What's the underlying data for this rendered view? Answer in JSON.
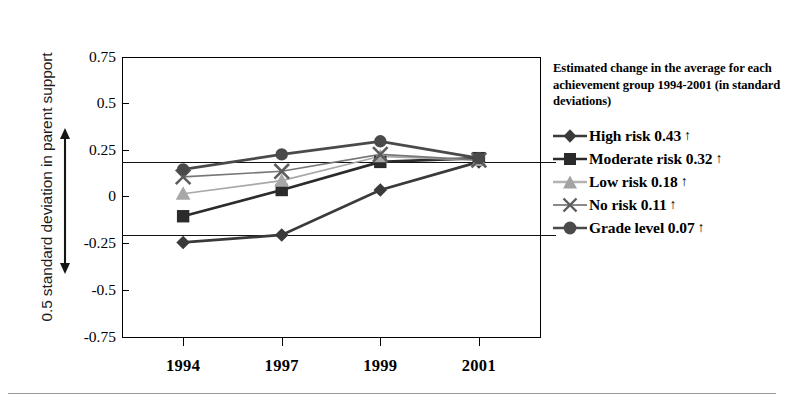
{
  "chart_data": {
    "type": "line",
    "title": "",
    "xlabel": "",
    "ylabel": "0.5 standard deviation in parent support",
    "categories": [
      "1994",
      "1997",
      "1999",
      "2001"
    ],
    "ylim": [
      -0.75,
      0.75
    ],
    "yticks": [
      "0.75",
      "0.5",
      "0.25",
      "0",
      "-0.25",
      "-0.5",
      "-0.75"
    ],
    "ytick_values": [
      0.75,
      0.5,
      0.25,
      0,
      -0.25,
      -0.5,
      -0.75
    ],
    "grid": false,
    "legend_position": "right",
    "reference_lines": [
      0.19,
      -0.2
    ],
    "series": [
      {
        "name": "High risk",
        "marker": "diamond",
        "color": "#3a3a3a",
        "change": "0.43",
        "direction": "up",
        "values": [
          -0.24,
          -0.2,
          0.04,
          0.19
        ]
      },
      {
        "name": "Moderate risk",
        "marker": "square",
        "color": "#2b2b2b",
        "change": "0.32",
        "direction": "up",
        "values": [
          -0.1,
          0.04,
          0.19,
          0.21
        ]
      },
      {
        "name": "Low risk",
        "marker": "triangle",
        "color": "#a8a8a8",
        "change": "0.18",
        "direction": "up",
        "values": [
          0.02,
          0.09,
          0.22,
          0.2
        ]
      },
      {
        "name": "No risk",
        "marker": "x",
        "color": "#777777",
        "change": "0.11",
        "direction": "up",
        "values": [
          0.11,
          0.14,
          0.23,
          0.2
        ]
      },
      {
        "name": "Grade level",
        "marker": "circle",
        "color": "#4a4a4a",
        "change": "0.07",
        "direction": "up",
        "values": [
          0.15,
          0.23,
          0.3,
          0.21
        ]
      }
    ]
  },
  "legend": {
    "caption": "Estimated change in the average for each achievement group 1994-2001 (in standard deviations)",
    "arrow_glyph": "↑",
    "entries": [
      {
        "label": "High risk 0.43",
        "marker_name": "diamond-marker-icon"
      },
      {
        "label": "Moderate risk 0.32",
        "marker_name": "square-marker-icon"
      },
      {
        "label": "Low risk 0.18",
        "marker_name": "triangle-marker-icon"
      },
      {
        "label": "No risk 0.11",
        "marker_name": "x-marker-icon"
      },
      {
        "label": "Grade level 0.07",
        "marker_name": "circle-marker-icon"
      }
    ]
  },
  "axis": {
    "y_title": "0.5 standard deviation in parent support",
    "span_arrow_name": "half-sd-span-arrow"
  }
}
